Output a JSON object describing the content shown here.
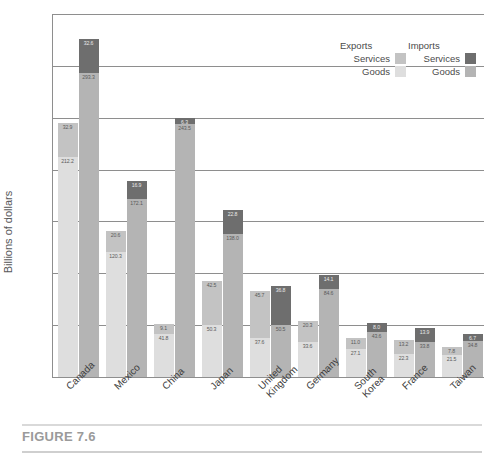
{
  "figure": {
    "caption": "FIGURE 7.6"
  },
  "chart_data": {
    "type": "bar",
    "title": "",
    "subtitle": "",
    "xlabel": "",
    "ylabel": "Billions of dollars",
    "ylim": [
      0,
      350
    ],
    "yticks": [
      0,
      50,
      100,
      150,
      200,
      250,
      300,
      350
    ],
    "grid": true,
    "stacked": true,
    "grouped": true,
    "legend_position": "top-right",
    "legend": {
      "groups": [
        {
          "name": "Exports",
          "entries": [
            {
              "label": "Services",
              "color": "#c3c3c3"
            },
            {
              "label": "Goods",
              "color": "#dedede"
            }
          ]
        },
        {
          "name": "Imports",
          "entries": [
            {
              "label": "Services",
              "color": "#6e6e6e"
            },
            {
              "label": "Goods",
              "color": "#b4b4b4"
            }
          ]
        }
      ]
    },
    "categories": [
      "Canada",
      "Mexico",
      "China",
      "Japan",
      "United\nKingdom",
      "Germany",
      "South\nKorea",
      "France",
      "Taiwan"
    ],
    "series": [
      {
        "name": "Exports Goods",
        "group": "Exports",
        "segment": "Goods",
        "color": "#dedede",
        "values": [
          212.2,
          120.3,
          41.8,
          50.3,
          37.6,
          33.6,
          27.1,
          22.3,
          21.5
        ]
      },
      {
        "name": "Exports Services",
        "group": "Exports",
        "segment": "Services",
        "color": "#c3c3c3",
        "values": [
          32.9,
          20.6,
          9.1,
          42.5,
          45.7,
          20.3,
          11.0,
          13.2,
          7.8
        ]
      },
      {
        "name": "Imports Goods",
        "group": "Imports",
        "segment": "Goods",
        "color": "#b4b4b4",
        "values": [
          293.3,
          172.1,
          243.5,
          138.0,
          50.5,
          84.6,
          43.6,
          33.8,
          34.8
        ]
      },
      {
        "name": "Imports Services",
        "group": "Imports",
        "segment": "Services",
        "color": "#6e6e6e",
        "values": [
          32.6,
          16.9,
          6.3,
          22.8,
          36.8,
          14.1,
          8.0,
          13.9,
          6.7
        ]
      }
    ]
  }
}
